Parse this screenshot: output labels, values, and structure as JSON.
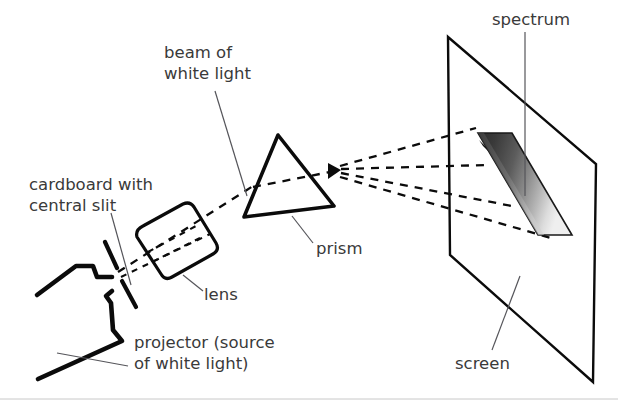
{
  "figure": {
    "background_color": "#ffffff",
    "ink_color": "#0b0b0b",
    "label_color": "#3a3a3a",
    "leader_color": "#55555a"
  },
  "labels": {
    "beam": "beam of\nwhite light",
    "beam_line1": "beam of",
    "beam_line2": "white light",
    "cardboard_line1": "cardboard with",
    "cardboard_line2": "central slit",
    "lens": "lens",
    "prism": "prism",
    "projector_line1": "projector (source",
    "projector_line2": "of white light)",
    "spectrum": "spectrum",
    "screen": "screen"
  },
  "components": {
    "projector": {
      "name": "projector",
      "role": "source of white light"
    },
    "cardboard": {
      "name": "cardboard with central slit",
      "role": "narrow slit aperture"
    },
    "lens": {
      "name": "lens",
      "role": "focuses the beam"
    },
    "prism": {
      "name": "prism",
      "role": "disperses white light"
    },
    "screen": {
      "name": "screen",
      "role": "displays the spectrum"
    },
    "spectrum": {
      "name": "spectrum",
      "role": "band of dispersed colours",
      "gradient_from": "#2f2f2f",
      "gradient_to": "#f2f2f2"
    }
  },
  "rays": {
    "count_after_prism": 4,
    "style": "dashed",
    "description": "white light beam travels from projector through slit and lens into prism, then fans out onto the screen"
  }
}
